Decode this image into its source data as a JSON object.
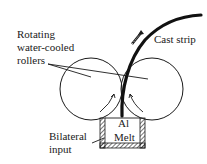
{
  "diagram": {
    "type": "twin-roll-casting-schematic",
    "labels": {
      "rollers_line1": "Rotating",
      "rollers_line2": "water-cooled",
      "rollers_line3": "rollers",
      "strip": "Cast strip",
      "melt_line1": "Al",
      "melt_line2": "Melt",
      "input_line1": "Bilateral",
      "input_line2": "input"
    },
    "components": [
      {
        "id": "left-roller",
        "shape": "circle"
      },
      {
        "id": "right-roller",
        "shape": "circle"
      },
      {
        "id": "cast-strip",
        "shape": "curve"
      },
      {
        "id": "melt-box",
        "shape": "hatched-container"
      }
    ],
    "colors": {
      "stroke": "#1a1a1a",
      "background": "#ffffff"
    }
  }
}
